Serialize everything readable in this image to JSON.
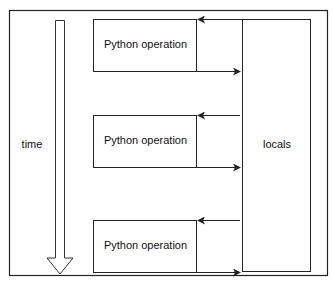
{
  "diagram": {
    "time_label": "time",
    "locals_label": "locals",
    "operations": [
      {
        "label": "Python operation"
      },
      {
        "label": "Python operation"
      },
      {
        "label": "Python operation"
      }
    ],
    "colors": {
      "stroke": "#222222",
      "background": "#ffffff"
    }
  }
}
